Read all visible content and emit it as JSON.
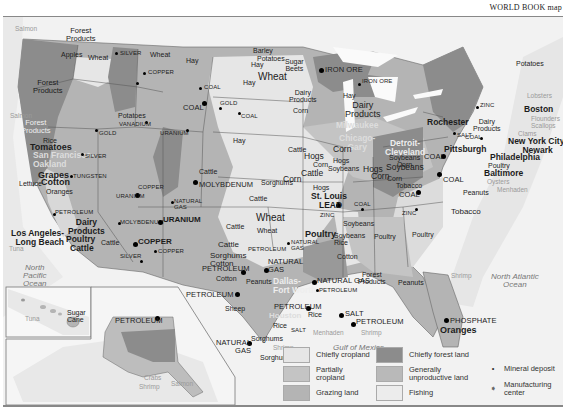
{
  "credit": "WORLD BOOK map",
  "colors": {
    "chiefly_cropland": "#e6e6e6",
    "partially_cropland": "#c4c4c4",
    "grazing_land": "#b4b4b4",
    "chiefly_forest_land": "#8c8c8c",
    "generally_unproductive_land": "#b9b9b9",
    "fishing": "#ececec",
    "water": "#f5f5f5",
    "ocean_fishing_band": "#e9e9e9"
  },
  "labels": {
    "salmon_nw": "Salmon",
    "forest_products_1": "Forest\nProducts",
    "apples": "Apples",
    "wheat_wa": "Wheat",
    "silver_id": "SILVER",
    "wheat_mt": "Wheat",
    "copper_mt": "COPPER",
    "forest_products_2": "Forest\nProducts",
    "salmon_or": "Salmon",
    "forest_products_3": "Forest\nProducts",
    "potatoes_id": "Potatoes",
    "vanadium": "VANADIUM",
    "gold_nv": "GOLD",
    "uranium_wy": "URANIUM",
    "coal_wy1": "COAL",
    "coal_wy2": "COAL",
    "coal_mt": "COAL",
    "gold_sd": "GOLD",
    "coal_nd": "COAL",
    "hay_mt": "Hay",
    "barley": "Barley",
    "potatoes_nd": "Potatoes",
    "hay_nd": "Hay",
    "wheat_nd": "Wheat",
    "sugar_beets": "Sugar\nBeets",
    "hay_sd": "Hay",
    "hay_ne": "Hay",
    "iron_ore_mn": "IRON ORE",
    "iron_ore_mi": "IRON ORE",
    "dairy_mn": "Dairy\nProducts",
    "corn_mn": "Corn",
    "hay_wi": "Hay",
    "dairy_wi": "Dairy\nProducts",
    "milwaukee": "Milwaukee",
    "chicago_gary": "Chicago-\nGary",
    "detroit_cleveland": "Detroit-\nCleveland",
    "rochester": "Rochester",
    "zinc_ny": "ZINC",
    "dairy_ny": "Dairy\nProducts",
    "salt_ny": "SALT",
    "potatoes_me": "Potatoes",
    "lobsters": "Lobsters",
    "boston": "Boston",
    "flounders": "Flounders",
    "scallops": "Scallops",
    "clams": "Clams",
    "coal_pa": "COAL",
    "new_york_newark": "New York City-\nNewark",
    "philadelphia": "Philadelphia",
    "poultry_md": "Poultry",
    "baltimore": "Baltimore",
    "oysters": "Oysters",
    "pittsburgh": "Pittsburgh",
    "coal_oh": "COAL",
    "soybeans_corn_oh": "Soybeans\nCorn",
    "coal_wv": "COAL",
    "tobacco_ky": "Tobacco",
    "coal_ky": "COAL",
    "peanuts_va": "Peanuts",
    "menhaden_atl": "Menhaden",
    "tobacco_nc": "Tobacco",
    "zinc_tn": "ZINC",
    "poultry_ga": "Poultry",
    "poultry_al": "Poultry",
    "shrimp_atl": "Shrimp",
    "north_atlantic": "North Atlantic\nOcean",
    "forest_products_se": "Forest\nProducts",
    "peanuts_ga": "Peanuts",
    "phosphate": "PHOSPHATE",
    "oranges_fl": "Oranges",
    "cattle_ne": "Cattle",
    "hogs_ne": "Hogs",
    "corn_ne": "Corn",
    "corn_ia": "Corn",
    "hogs_ia": "Hogs",
    "soybeans_ia": "Soybeans",
    "cattle_ia": "Cattle",
    "corn_ne2": "Corn",
    "hogs_il": "Hogs",
    "soybeans_il": "Soybeans",
    "corn_il": "Corn",
    "corn_in": "Corn",
    "sorghums_ks": "Sorghums",
    "cattle_co": "Cattle",
    "molybdenum": "MOLYBDENUM",
    "cattle_ks": "Cattle",
    "hogs_mo": "Hogs",
    "st_louis": "St. Louis",
    "lead": "LEAD",
    "zinc_mo": "ZINC",
    "coal_il": "COAL",
    "soybeans_mo": "Soybeans",
    "wheat_ks": "Wheat",
    "cattle_ok": "Cattle",
    "wheat_ok": "Wheat",
    "poultry_ar": "Poultry",
    "soybeans_rice": "Soybeans\nRice",
    "petroleum_ok": "PETROLEUM",
    "natural_gas_ok": "NATURAL\nGAS",
    "cattle_tx": "Cattle",
    "sorghums_cotton": "Sorghums\nCotton",
    "natural_gas_tx": "NATURAL\nGAS",
    "petroleum_tx1": "PETROLEUM",
    "cotton_tx": "Cotton",
    "peanuts_tx": "Peanuts",
    "dallas": "Dallas-\nFort Worth",
    "cotton_ms": "Cotton",
    "natural_gas_la": "NATURAL GAS",
    "petroleum_la": "PETROLEUM",
    "petroleum_tx2": "PETROLEUM",
    "sheep": "Sheep",
    "houston": "Houston",
    "rice_tx": "Rice",
    "salt_tx": "SALT",
    "rice_la": "Rice",
    "salt_la": "SALT",
    "petroleum_gulf": "PETROLEUM",
    "menhaden_gulf": "Menhaden",
    "shrimp_gulf": "Shrimp",
    "natural_gas_s_tx": "NATURAL\nGAS",
    "sorghums_tx1": "Sorghums",
    "sorghums_tx2": "Sorghums",
    "shrimp_tx": "Shrimp",
    "gulf_of_mexico": "Gulf of Mexico",
    "rice_ca": "Rice",
    "tomatoes": "Tomatoes",
    "san_francisco": "San Francisco-\nOakland",
    "grapes": "Grapes",
    "lettuce": "Lettuce",
    "cotton_ca": "Cotton",
    "oranges_ca": "Oranges",
    "silver_nv": "SILVER",
    "tungsten": "TUNGSTEN",
    "copper_ut": "COPPER",
    "uranium_ut": "URANIUM",
    "petroleum_ca": "PETROLEUM",
    "dairy_ca": "Dairy\nProducts",
    "poultry_ca": "Poultry",
    "cattle_ca": "Cattle",
    "los_angeles": "Los Angeles-\nLong Beach",
    "tuna_ca": "Tuna",
    "molybdenum_nm": "MOLYBDENUM",
    "uranium_nm": "URANIUM",
    "natural_gas_nm": "NATURAL\nGAS",
    "cattle_az": "Cattle",
    "copper_az": "COPPER",
    "copper_nm": "COPPER",
    "silver_az": "SILVER",
    "petroleum_nm": "PETROLEUM",
    "north_pacific": "North\nPacific\nOcean",
    "tuna_hi": "Tuna",
    "sugar_cane": "Sugar\nCane",
    "petroleum_ak": "PETROLEUM",
    "crabs": "Crabs",
    "shrimp_ak": "Shrimp",
    "salmon_ak": "Salmon"
  },
  "legend": {
    "items": [
      {
        "label": "Chiefly cropland",
        "color": "#e6e6e6"
      },
      {
        "label": "Partially\ncropland",
        "color": "#c4c4c4"
      },
      {
        "label": "Grazing land",
        "color": "#b4b4b4"
      },
      {
        "label": "Chiefly forest land",
        "color": "#8c8c8c"
      },
      {
        "label": "Generally\nunproductive land",
        "color": "#b9b9b9"
      },
      {
        "label": "Fishing",
        "color": "#ececec"
      }
    ],
    "symbols": [
      {
        "label": "Mineral deposit",
        "glyph": "•"
      },
      {
        "label": "Manufacturing\ncenter",
        "glyph": "➧"
      }
    ]
  }
}
